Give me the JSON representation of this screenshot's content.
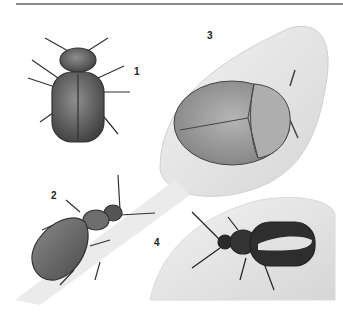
{
  "plate": {
    "description": "Illustrated plate of four leaf beetles",
    "colors": {
      "background": "#ffffff",
      "rule": "#8a8a8a",
      "beetle_dark": "#3a3a3a",
      "beetle_mid": "#7d7d7d",
      "leaf": "#e4e4e4"
    },
    "figures": [
      {
        "number": "1",
        "subject": "round-bodied beetle, dorsal view"
      },
      {
        "number": "2",
        "subject": "elongated beetle on grass blade"
      },
      {
        "number": "3",
        "subject": "tortoise beetle on leaf"
      },
      {
        "number": "4",
        "subject": "striped flea beetle on leaf"
      }
    ]
  }
}
